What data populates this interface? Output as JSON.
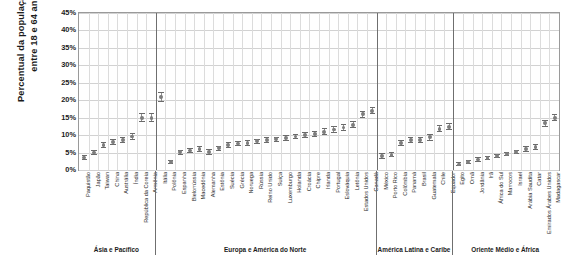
{
  "chart_data": {
    "type": "scatter",
    "title": "",
    "ylabel": "Percentual da população adulta entre 18 e 64 anos",
    "xlabel": "",
    "ylim": [
      0,
      45
    ],
    "ytick_labels": [
      "0%",
      "5%",
      "10%",
      "15%",
      "20%",
      "25%",
      "30%",
      "35%",
      "40%",
      "45%"
    ],
    "ytick_values": [
      0,
      5,
      10,
      15,
      20,
      25,
      30,
      35,
      40,
      45
    ],
    "grid": true,
    "legend": "none",
    "marker_note": "vertical range bar with central point estimate",
    "groups": [
      {
        "name": "Ásia e Pacífico",
        "start": 0,
        "end": 7
      },
      {
        "name": "Europa e América do Norte",
        "start": 8,
        "end": 30
      },
      {
        "name": "América Latina e Caribe",
        "start": 31,
        "end": 38
      },
      {
        "name": "Oriente Médio e África",
        "start": 39,
        "end": 49
      }
    ],
    "categories": [
      "Paquistão",
      "Japão",
      "Taiwan",
      "China",
      "Austrália",
      "Índia",
      "República da Coreia",
      "Armênia",
      "Itália",
      "Polônia",
      "Espanha",
      "Bielorrússia",
      "Macedônia",
      "Alemanha",
      "Estônia",
      "Suécia",
      "Grécia",
      "Noruega",
      "Rússia",
      "Reino Unido",
      "Suíça",
      "Luxemburgo",
      "Holanda",
      "Croácia",
      "Chipre",
      "Irlanda",
      "Portugal",
      "Eslováquia",
      "Letônia",
      "Estados Unidos",
      "Canadá",
      "México",
      "Porto Rico",
      "Colômbia",
      "Panamá",
      "Brasil",
      "Guatemala",
      "Chile",
      "Equador",
      "Egito",
      "Omã",
      "Jordânia",
      "Irã",
      "África do Sul",
      "Marrocos",
      "Israel",
      "Arábia Saudita",
      "Catar",
      "Emirados Árabes Unidos",
      "Madagascar"
    ],
    "values": [
      3.6,
      5.0,
      7.2,
      8.0,
      8.6,
      9.6,
      15.0,
      15.0,
      21.0,
      2.4,
      5.1,
      5.6,
      6.0,
      5.2,
      6.2,
      7.2,
      7.6,
      7.8,
      8.2,
      8.6,
      8.8,
      9.2,
      9.6,
      10.0,
      10.4,
      11.0,
      11.6,
      12.2,
      13.0,
      16.0,
      17.0,
      4.0,
      4.4,
      7.8,
      8.6,
      8.6,
      9.4,
      11.8,
      12.4,
      1.6,
      2.2,
      3.0,
      3.4,
      4.0,
      4.6,
      5.2,
      6.0,
      6.6,
      13.4,
      15.0
    ],
    "lower": [
      2.8,
      4.2,
      6.4,
      7.2,
      7.8,
      8.6,
      13.8,
      13.8,
      19.6,
      1.8,
      4.4,
      4.8,
      5.2,
      4.4,
      5.4,
      6.4,
      6.8,
      7.0,
      7.4,
      7.8,
      8.0,
      8.4,
      8.8,
      9.2,
      9.6,
      10.0,
      10.6,
      11.2,
      12.0,
      15.0,
      16.0,
      3.2,
      3.6,
      7.0,
      7.8,
      7.8,
      8.4,
      10.8,
      11.4,
      1.0,
      1.6,
      2.4,
      2.8,
      3.4,
      4.0,
      4.6,
      5.2,
      5.8,
      12.4,
      14.0
    ],
    "upper": [
      4.4,
      5.8,
      8.0,
      8.8,
      9.4,
      10.6,
      16.2,
      16.2,
      22.4,
      3.0,
      5.8,
      6.4,
      6.8,
      6.0,
      7.0,
      8.0,
      8.4,
      8.6,
      9.0,
      9.4,
      9.6,
      10.0,
      10.4,
      10.8,
      11.2,
      12.0,
      12.6,
      13.2,
      14.0,
      17.0,
      18.0,
      4.8,
      5.2,
      8.6,
      9.4,
      9.4,
      10.4,
      12.8,
      13.4,
      2.2,
      2.8,
      3.6,
      4.0,
      4.6,
      5.2,
      5.8,
      6.8,
      7.4,
      14.4,
      16.0
    ]
  },
  "colors": {
    "marker": "#8d8d8d",
    "grid": "#d2d2d2",
    "axis": "#9a9a9a",
    "separator": "#6f6f6f",
    "text": "#1b1b1b",
    "background": "#ffffff"
  }
}
